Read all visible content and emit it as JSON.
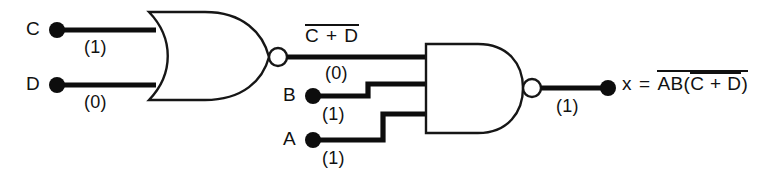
{
  "diagram": {
    "background_color": "#ffffff",
    "line_color": "#0d0d0d"
  },
  "inputs": [
    {
      "name": "C",
      "label": "C",
      "level": "(1)",
      "value": 1
    },
    {
      "name": "D",
      "label": "D",
      "level": "(0)",
      "value": 0
    },
    {
      "name": "B",
      "label": "B",
      "level": "(1)",
      "value": 1
    },
    {
      "name": "A",
      "label": "A",
      "level": "(1)",
      "value": 1
    }
  ],
  "gates": [
    {
      "name": "nor-gate",
      "type": "NOR",
      "inputs": [
        "C",
        "D"
      ],
      "output_expression": "C + D",
      "output_expression_overbar": true,
      "output_level": "(0)",
      "output_value": 0
    },
    {
      "name": "nand-gate",
      "type": "NAND",
      "inputs": [
        "NOR output",
        "B",
        "A"
      ],
      "output_level": "(1)",
      "output_value": 1
    }
  ],
  "nets": {
    "nor_output_label": "C + D",
    "nor_output_level": "(0)",
    "final_output_level": "(1)"
  },
  "output": {
    "name": "x",
    "variable": "x",
    "equals": "=",
    "expression_outer": "AB(",
    "expression_inner": "C + D",
    "expression_close": ")",
    "full_expression": "x = AB(C + D)",
    "outer_overbar": true,
    "inner_overbar": true
  }
}
